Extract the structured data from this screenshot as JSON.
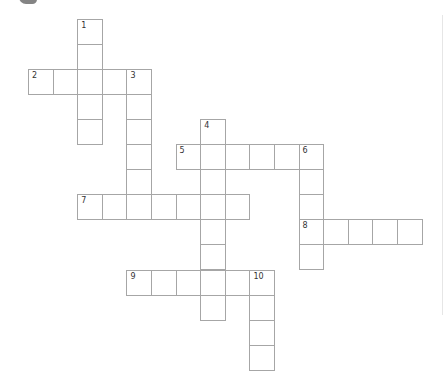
{
  "puzzle": {
    "type": "crossword",
    "cell_size": {
      "w": 24.6,
      "h": 25.1
    },
    "origin": {
      "x": 28,
      "y": 18.5
    },
    "colors": {
      "grid_line": "#a6a6a6",
      "cell_fill": "#ffffff",
      "number": "#333333",
      "background": "#ffffff"
    },
    "entries": [
      {
        "number": "1",
        "direction": "down",
        "row": 0,
        "col": 2,
        "length": 5
      },
      {
        "number": "2",
        "direction": "across",
        "row": 2,
        "col": 0,
        "length": 5
      },
      {
        "number": "3",
        "direction": "down",
        "row": 2,
        "col": 4,
        "length": 6
      },
      {
        "number": "4",
        "direction": "down",
        "row": 4,
        "col": 7,
        "length": 8
      },
      {
        "number": "5",
        "direction": "across",
        "row": 5,
        "col": 6,
        "length": 6
      },
      {
        "number": "6",
        "direction": "down",
        "row": 5,
        "col": 11,
        "length": 5
      },
      {
        "number": "7",
        "direction": "across",
        "row": 7,
        "col": 2,
        "length": 7
      },
      {
        "number": "8",
        "direction": "across",
        "row": 8,
        "col": 11,
        "length": 5
      },
      {
        "number": "9",
        "direction": "across",
        "row": 10,
        "col": 4,
        "length": 6
      },
      {
        "number": "10",
        "direction": "down",
        "row": 10,
        "col": 9,
        "length": 4
      }
    ]
  }
}
